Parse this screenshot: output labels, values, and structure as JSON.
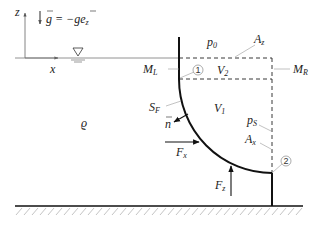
{
  "diagram": {
    "type": "hydrostatic force on curved surface",
    "axes": {
      "z_label": "z",
      "x_label": "x"
    },
    "gravity": {
      "label": "g = −g e_z",
      "g": "g",
      "eq": " = −g",
      "e": "e",
      "e_sub": "z"
    },
    "density": {
      "label": "ϱ"
    },
    "pressure_top": {
      "p": "p",
      "sub": "0"
    },
    "pressure_side": {
      "p": "p",
      "sub": "S"
    },
    "areas": {
      "Az": {
        "A": "A",
        "sub": "z"
      },
      "Ax": {
        "A": "A",
        "sub": "x"
      }
    },
    "volumes": {
      "V1": {
        "V": "V",
        "sub": "1"
      },
      "V2": {
        "V": "V",
        "sub": "2"
      }
    },
    "points": {
      "ML": {
        "M": "M",
        "sub": "L"
      },
      "MR": {
        "M": "M",
        "sub": "R"
      }
    },
    "surface": {
      "S": "S",
      "sub": "F"
    },
    "normal": {
      "label": "n"
    },
    "forces": {
      "Fx": {
        "F": "F",
        "sub": "x"
      },
      "Fz": {
        "F": "F",
        "sub": "z"
      }
    },
    "markers": {
      "m1": "1",
      "m2": "2"
    },
    "colors": {
      "line": "#111111",
      "dashed": "#222222",
      "leader": "#999999",
      "hatch": "#aaaaaa"
    }
  }
}
